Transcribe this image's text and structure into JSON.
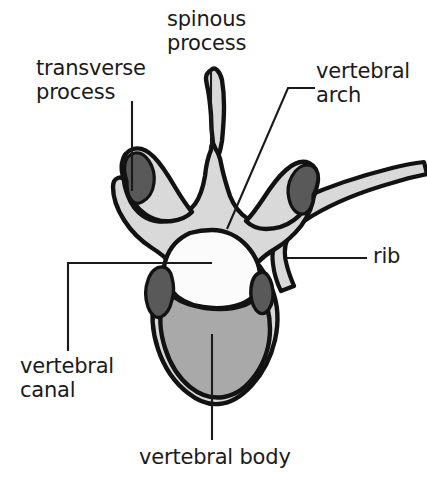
{
  "figure": {
    "width": 427,
    "height": 488,
    "background": "#ffffff"
  },
  "colors": {
    "outline": "#121212",
    "bone_light": "#d9d9d9",
    "vertebral_body": "#a9a9a9",
    "facet_dark": "#595959",
    "canal_fill": "#fbfbfb",
    "label_text": "#1a1a1a",
    "leader_line": "#1a1a1a"
  },
  "labels": [
    {
      "id": "transverse-process",
      "lines": [
        "transverse",
        "process"
      ],
      "text": "transverse process",
      "x": 36,
      "y": 57,
      "align": "left"
    },
    {
      "id": "spinous-process",
      "lines": [
        "spinous",
        "process"
      ],
      "text": "spinous process",
      "x": 167,
      "y": 8,
      "align": "left"
    },
    {
      "id": "vertebral-arch",
      "lines": [
        "vertebral",
        "arch"
      ],
      "text": "vertebral arch",
      "x": 316,
      "y": 60,
      "align": "left"
    },
    {
      "id": "rib",
      "lines": [
        "rib"
      ],
      "text": "rib",
      "x": 373,
      "y": 245,
      "align": "left"
    },
    {
      "id": "vertebral-canal",
      "lines": [
        "vertebral",
        "canal"
      ],
      "text": "vertebral canal",
      "x": 20,
      "y": 355,
      "align": "left"
    },
    {
      "id": "vertebral-body",
      "lines": [
        "vertebral body"
      ],
      "text": "vertebral body",
      "x": 139,
      "y": 446,
      "align": "left"
    }
  ],
  "leader_lines": [
    {
      "id": "transverse-process",
      "points": "132,101 132,191"
    },
    {
      "id": "spinous-process",
      "points": "211,69 211,150"
    },
    {
      "id": "vertebral-arch",
      "points": "315,88 288,88 227,229"
    },
    {
      "id": "rib",
      "points": "367,258 287,258"
    },
    {
      "id": "vertebral-canal",
      "points": "68,351 68,263 212,263"
    },
    {
      "id": "vertebral-body",
      "points": "212,334 212,440"
    }
  ],
  "structures": [
    {
      "id": "vertebral-arch-body",
      "name": "vertebral arch and transverse processes",
      "fill": "#d9d9d9"
    },
    {
      "id": "vertebral-body-mass",
      "name": "vertebral body",
      "fill": "#a9a9a9"
    },
    {
      "id": "vertebral-canal-opening",
      "name": "vertebral canal",
      "fill": "#fbfbfb"
    },
    {
      "id": "rib-shaft",
      "name": "rib",
      "fill": "#d9d9d9"
    },
    {
      "id": "facet-left-transverse",
      "name": "left costal facet",
      "fill": "#595959"
    },
    {
      "id": "facet-right-transverse",
      "name": "right costal facet",
      "fill": "#595959"
    },
    {
      "id": "facet-left-inferior",
      "name": "left superior articular facet",
      "fill": "#595959"
    },
    {
      "id": "facet-right-inferior",
      "name": "right superior articular facet",
      "fill": "#595959"
    }
  ]
}
